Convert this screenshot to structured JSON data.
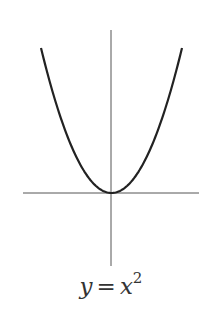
{
  "chart_data": {
    "type": "line",
    "function": "y = x^2",
    "x": [
      -1,
      -0.75,
      -0.5,
      -0.25,
      0,
      0.25,
      0.5,
      0.75,
      1
    ],
    "series": [
      {
        "name": "y = x^2",
        "values": [
          1,
          0.5625,
          0.25,
          0.0625,
          0,
          0.0625,
          0.25,
          0.5625,
          1
        ]
      }
    ],
    "xlabel": "",
    "ylabel": "",
    "grid": false,
    "axes_through_origin": true,
    "colors": {
      "curve": "#222222",
      "axes": "#555555"
    }
  },
  "caption": {
    "lhs": "y",
    "eq": "=",
    "base": "x",
    "exponent": "2"
  }
}
